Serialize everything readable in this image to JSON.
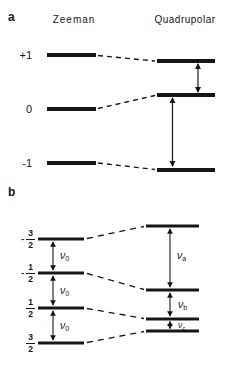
{
  "figure": {
    "background": "#ffffff",
    "ink": "#161616"
  },
  "panel_a": {
    "label": "a",
    "column_headers": {
      "left": "Zeeman",
      "right": "Quadrupolar"
    },
    "level_labels": [
      "+1",
      "0",
      "-1"
    ]
  },
  "panel_b": {
    "label": "b",
    "spin_labels": [
      {
        "sign": "-",
        "numerator": "3",
        "denominator": "2"
      },
      {
        "sign": "-",
        "numerator": "1",
        "denominator": "2"
      },
      {
        "sign": "",
        "numerator": "1",
        "denominator": "2"
      },
      {
        "sign": "",
        "numerator": "3",
        "denominator": "2"
      }
    ],
    "zeeman_transitions": [
      {
        "symbol": "ν",
        "subscript": "0"
      },
      {
        "symbol": "ν",
        "subscript": "0"
      },
      {
        "symbol": "ν",
        "subscript": "0"
      }
    ],
    "quadrupolar_transitions": [
      {
        "symbol": "ν",
        "subscript": "a"
      },
      {
        "symbol": "ν",
        "subscript": "b"
      },
      {
        "symbol": "ν",
        "subscript": "c"
      }
    ]
  }
}
